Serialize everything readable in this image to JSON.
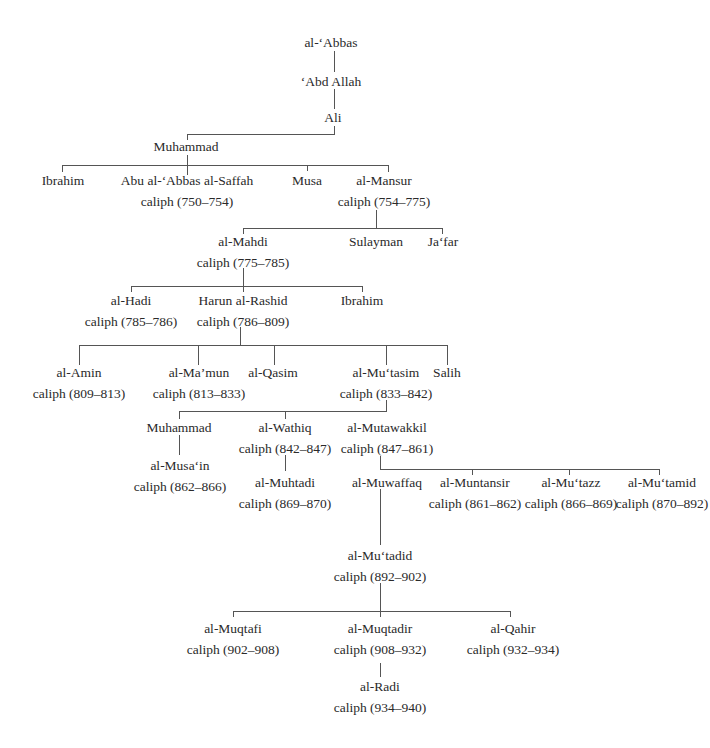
{
  "line_color": "#555555",
  "nodes": {
    "abbas": {
      "name": "al-‘Abbas"
    },
    "abd_allah": {
      "name": "‘Abd Allah"
    },
    "ali": {
      "name": "Ali"
    },
    "muhammad1": {
      "name": "Muhammad"
    },
    "ibrahim1": {
      "name": "Ibrahim"
    },
    "saffah": {
      "name": "Abu al-‘Abbas al-Saffah",
      "reign": "caliph (750–754)"
    },
    "musa": {
      "name": "Musa"
    },
    "mansur": {
      "name": "al-Mansur",
      "reign": "caliph (754–775)"
    },
    "mahdi": {
      "name": "al-Mahdi",
      "reign": "caliph (775–785)"
    },
    "sulayman": {
      "name": "Sulayman"
    },
    "jafar": {
      "name": "Ja‘far"
    },
    "hadi": {
      "name": "al-Hadi",
      "reign": "caliph (785–786)"
    },
    "harun": {
      "name": "Harun al-Rashid",
      "reign": "caliph (786–809)"
    },
    "ibrahim2": {
      "name": "Ibrahim"
    },
    "amin": {
      "name": "al-Amin",
      "reign": "caliph (809–813)"
    },
    "mamun": {
      "name": "al-Ma’mun",
      "reign": "caliph (813–833)"
    },
    "qasim": {
      "name": "al-Qasim"
    },
    "mutasim": {
      "name": "al-Mu‘tasim",
      "reign": "caliph (833–842)"
    },
    "salih": {
      "name": "Salih"
    },
    "muhammad2": {
      "name": "Muhammad"
    },
    "wathiq": {
      "name": "al-Wathiq",
      "reign": "caliph (842–847)"
    },
    "mutawakkil": {
      "name": "al-Mutawakkil",
      "reign": "caliph (847–861)"
    },
    "musain": {
      "name": "al-Musa‘in",
      "reign": "caliph (862–866)"
    },
    "muhtadi": {
      "name": "al-Muhtadi",
      "reign": "caliph (869–870)"
    },
    "muwaffaq": {
      "name": "al-Muwaffaq"
    },
    "muntansir": {
      "name": "al-Muntansir",
      "reign": "caliph (861–862)"
    },
    "mutazz": {
      "name": "al-Mu‘tazz",
      "reign": "caliph (866–869)"
    },
    "mutamid": {
      "name": "al-Mu‘tamid",
      "reign": "caliph (870–892)"
    },
    "mutadid": {
      "name": "al-Mu‘tadid",
      "reign": "caliph (892–902)"
    },
    "muqtafi": {
      "name": "al-Muqtafi",
      "reign": "caliph (902–908)"
    },
    "muqtadir": {
      "name": "al-Muqtadir",
      "reign": "caliph (908–932)"
    },
    "qahir": {
      "name": "al-Qahir",
      "reign": "caliph (932–934)"
    },
    "radi": {
      "name": "al-Radi",
      "reign": "caliph (934–940)"
    }
  }
}
